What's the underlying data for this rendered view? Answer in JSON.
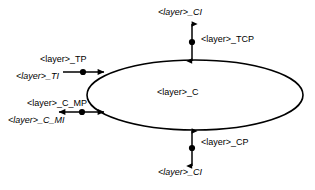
{
  "diagram": {
    "stroke_color": "#000000",
    "fill_color": "#ffffff",
    "node": {
      "shape": "ellipse",
      "label": "<layer>_C"
    },
    "labels": {
      "top_interface": "<layer>_CI",
      "top_port": "<layer>_TCP",
      "left_top_port": "<layer>_TP",
      "left_top_interface": "<layer>_TI",
      "left_mid_port": "<layer>_C_MP",
      "left_mid_interface": "<layer>_C_MI",
      "bottom_port": "<layer>_CP",
      "bottom_interface": "<layer>_CI"
    }
  }
}
